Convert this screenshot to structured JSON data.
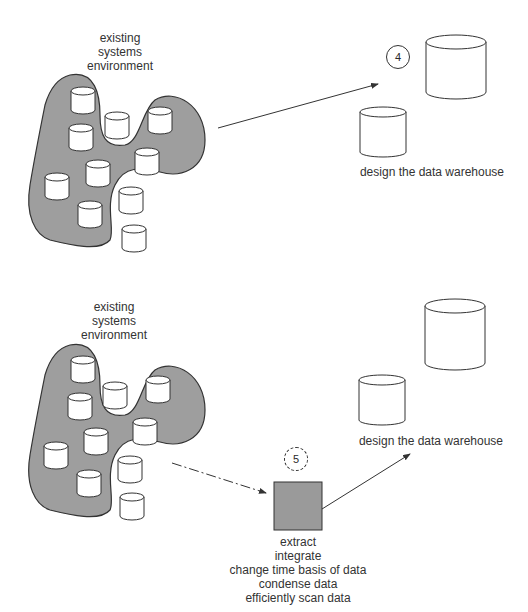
{
  "panels": [
    {
      "id": "step4",
      "source_label": [
        "existing",
        "systems",
        "environment"
      ],
      "step_number": "4",
      "target_label": "design the data warehouse"
    },
    {
      "id": "step5",
      "source_label": [
        "existing",
        "systems",
        "environment"
      ],
      "step_number": "5",
      "target_label": "design the data warehouse",
      "process_label": [
        "extract",
        "integrate",
        "change time basis of data",
        "condense data",
        "efficiently scan data"
      ]
    }
  ],
  "colors": {
    "blob_fill": "#9e9e9e",
    "process_box_fill": "#9a9a9a",
    "stroke": "#333333"
  }
}
